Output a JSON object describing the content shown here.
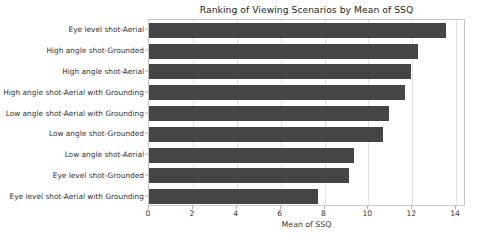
{
  "chart_data": {
    "type": "bar",
    "orientation": "horizontal",
    "title": "Ranking of Viewing Scenarios by Mean of SSQ",
    "xlabel": "Mean of SSQ",
    "ylabel": "",
    "xlim": [
      0,
      14.45
    ],
    "ylim": [
      0,
      9
    ],
    "grid": true,
    "legend": null,
    "bar_color": "#454545",
    "categories": [
      "Eye level shot-Aerial",
      "High angle shot-Grounded",
      "High angle shot-Aerial",
      "High angle shot-Aerial with Grounding",
      "Low angle shot-Aerial with Grounding",
      "Low angle shot-Grounded",
      "Low angle shot-Aerial",
      "Eye level shot-Grounded",
      "Eye level shot-Aerial with Grounding"
    ],
    "values": [
      13.55,
      12.25,
      11.95,
      11.65,
      10.95,
      10.65,
      9.35,
      9.1,
      7.7
    ],
    "xticks": [
      0,
      2,
      4,
      6,
      8,
      10,
      12,
      14
    ],
    "xtick_labels": [
      "0",
      "2",
      "4",
      "6",
      "8",
      "10",
      "12",
      "14"
    ]
  }
}
